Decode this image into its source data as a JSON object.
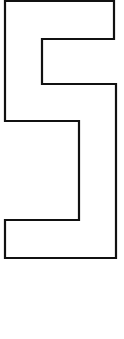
{
  "figure": {
    "glyph": "5",
    "shape": "outlined-digit",
    "stroke_color": "#111111",
    "fill_color": "#ffffff",
    "stroke_width": 2.2,
    "points": "5,1 114,1 114,39 42,39 42,84 116,84 116,258 5,258 5,220 79,220 79,121 5,121"
  }
}
